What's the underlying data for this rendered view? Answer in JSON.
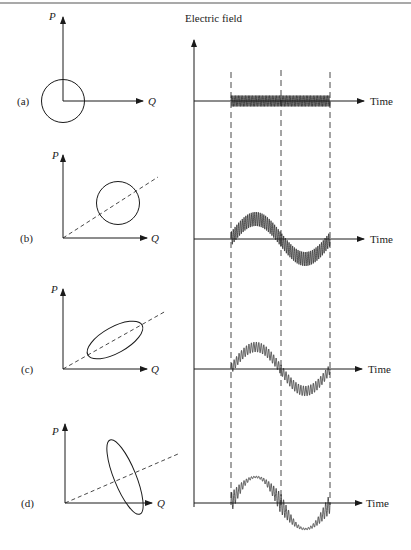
{
  "figure": {
    "right_axis_label": "Electric field",
    "time_label": "Time",
    "p_axis_label": "P",
    "q_axis_label": "Q",
    "panels": [
      {
        "tag": "(a)",
        "shape": "circle centered at origin",
        "signal": "rapid oscillation, zero mean"
      },
      {
        "tag": "(b)",
        "shape": "circle offset along dashed diagonal",
        "signal": "rapid oscillation riding on one sine period"
      },
      {
        "tag": "(c)",
        "shape": "ellipse elongated along dashed diagonal",
        "signal": "sine with smaller ripple"
      },
      {
        "tag": "(d)",
        "shape": "ellipse elongated perpendicular to dashed diagonal",
        "signal": "sine with ripple largest near zero crossings"
      }
    ]
  },
  "colors": {
    "ink": "#1a1a1a",
    "background": "#ffffff",
    "rule": "#555555"
  }
}
